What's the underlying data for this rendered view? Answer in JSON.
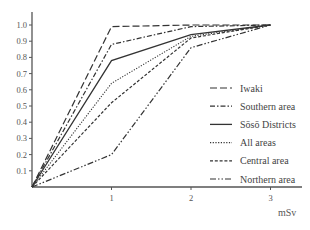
{
  "chart_data": {
    "type": "line",
    "title": "",
    "xlabel": "mSv",
    "ylabel": "",
    "x": [
      0,
      1,
      2,
      3
    ],
    "x_ticks": [
      "1",
      "2",
      "3"
    ],
    "y_ticks": [
      "0.1",
      "0.2",
      "0.3",
      "0.4",
      "0.5",
      "0.6",
      "0.7",
      "0.8",
      "0.9",
      "1.0"
    ],
    "xlim": [
      0,
      3.3
    ],
    "ylim": [
      0,
      1.05
    ],
    "grid": false,
    "legend_position": "right-center",
    "series": [
      {
        "name": "Iwaki",
        "style": "long-dash",
        "values": [
          0,
          0.99,
          1.0,
          1.0
        ]
      },
      {
        "name": "Southern area",
        "style": "dash-dot",
        "values": [
          0,
          0.88,
          0.99,
          1.0
        ]
      },
      {
        "name": "Sōsō Districts",
        "style": "solid",
        "values": [
          0,
          0.78,
          0.94,
          1.0
        ]
      },
      {
        "name": "All areas",
        "style": "dotted",
        "values": [
          0,
          0.64,
          0.93,
          1.0
        ]
      },
      {
        "name": "Central area",
        "style": "short-dash",
        "values": [
          0,
          0.52,
          0.92,
          1.0
        ]
      },
      {
        "name": "Northern area",
        "style": "dash-dot-dot",
        "values": [
          0,
          0.2,
          0.86,
          1.0
        ]
      }
    ]
  }
}
